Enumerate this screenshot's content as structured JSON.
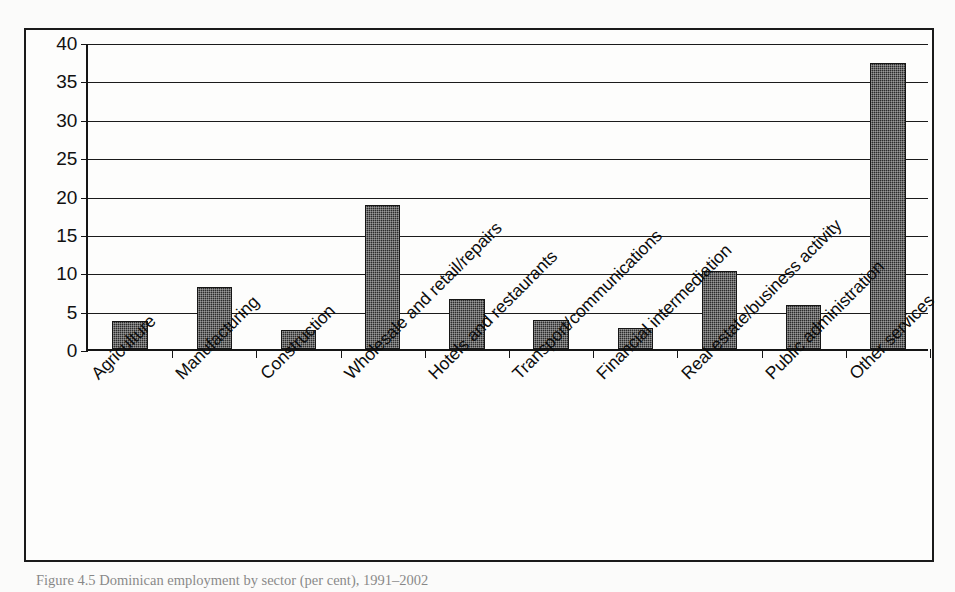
{
  "figure": {
    "caption": "Figure 4.5  Dominican employment by sector (per cent), 1991–2002"
  },
  "chart_data": {
    "type": "bar",
    "title": "",
    "xlabel": "",
    "ylabel": "",
    "ylim": [
      0,
      40
    ],
    "ytick_step": 5,
    "grid": true,
    "legend": "none",
    "bar_color": "#2b2b2b",
    "categories": [
      "Agriculture",
      "Manufacturing",
      "Construction",
      "Wholesale and retail/repairs",
      "Hotels and restaurants",
      "Transport/communications",
      "Financial intermediation",
      "Real estate/business activity",
      "Public administration",
      "Other services"
    ],
    "values": [
      3.7,
      8.1,
      2.5,
      18.7,
      6.5,
      3.8,
      2.7,
      10.2,
      5.7,
      37.3
    ],
    "ytick_labels": [
      "40",
      "35",
      "30",
      "25",
      "20",
      "15",
      "10",
      "5",
      "0"
    ],
    "ytick_values": [
      40,
      35,
      30,
      25,
      20,
      15,
      10,
      5,
      0
    ]
  }
}
